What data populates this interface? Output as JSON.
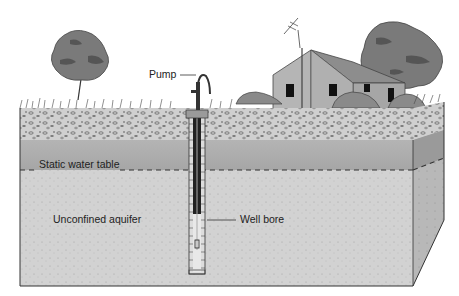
{
  "diagram": {
    "type": "cross-section",
    "labels": {
      "pump": "Pump",
      "static_water_table": "Static water table",
      "unconfined_aquifer": "Unconfined aquifer",
      "well_bore": "Well bore"
    },
    "layers": [
      {
        "name": "soil-gravel",
        "color": "#c9c9c9"
      },
      {
        "name": "unsaturated-zone",
        "color": "#a9a9a9"
      },
      {
        "name": "unconfined-aquifer",
        "color": "#d0d0d0"
      }
    ],
    "colors": {
      "tree": "#7a7a7a",
      "tree_dark": "#555555",
      "house_wall": "#b0b0b0",
      "roof": "#8a8a8a",
      "outline": "#333333"
    }
  }
}
